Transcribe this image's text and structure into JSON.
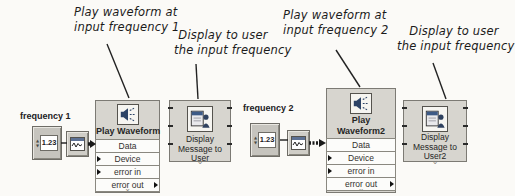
{
  "annotations": {
    "play1": {
      "line1": "Play waveform at",
      "line2": "input frequency 1"
    },
    "display1": {
      "line1": "Display to user",
      "line2": "the input frequency"
    },
    "play2": {
      "line1": "Play waveform at",
      "line2": "input frequency 2"
    },
    "display2": {
      "line1": "Display to user",
      "line2": "the input frequency"
    }
  },
  "controls": {
    "frequency1": {
      "label": "frequency 1",
      "terminal_value": "1.23"
    },
    "frequency2": {
      "label": "frequency 2",
      "terminal_value": "1.23"
    }
  },
  "nodes": {
    "play_waveform1": {
      "title": "Play Waveform",
      "rows": [
        "Data",
        "Device",
        "error in",
        "error out"
      ]
    },
    "play_waveform2": {
      "title_line1": "Play",
      "title_line2": "Waveform2",
      "rows": [
        "Data",
        "Device",
        "error in",
        "error out"
      ]
    },
    "display_message1": {
      "line1": "Display",
      "line2": "Message to",
      "line3": "User"
    },
    "display_message2": {
      "line1": "Display",
      "line2": "Message to",
      "line3": "User2"
    }
  },
  "glyphs": {
    "chevron": "⌄",
    "spin_up": "▲",
    "spin_down": "▼"
  },
  "colors": {
    "block_bg": "#d7d5cf",
    "block_border": "#7c7a74",
    "row_bg": "#fcfcfa",
    "icon_blue": "#2c4366",
    "titlebar_blue": "#3d5a86",
    "wire": "#1a1a1a",
    "annotation_text": "#1b1b1b"
  }
}
